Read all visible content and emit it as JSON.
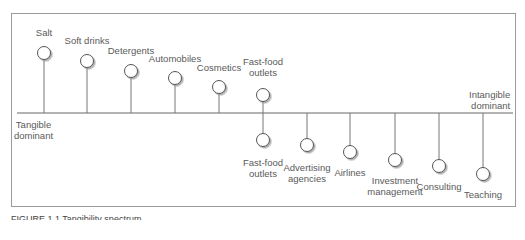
{
  "diagram": {
    "type": "tangibility-spectrum",
    "left_end": "Tangible\ndominant",
    "right_end": "Intangible\ndominant",
    "above_axis": [
      {
        "label": "Salt"
      },
      {
        "label": "Soft drinks"
      },
      {
        "label": "Detergents"
      },
      {
        "label": "Automobiles"
      },
      {
        "label": "Cosmetics"
      },
      {
        "label": "Fast-food\noutlets"
      }
    ],
    "below_axis": [
      {
        "label": "Fast-food\noutlets"
      },
      {
        "label": "Advertising\nagencies"
      },
      {
        "label": "Airlines"
      },
      {
        "label": "Investment\nmanagement"
      },
      {
        "label": "Consulting"
      },
      {
        "label": "Teaching"
      }
    ]
  },
  "caption": "FIGURE 1.1 Tangibility spectrum"
}
